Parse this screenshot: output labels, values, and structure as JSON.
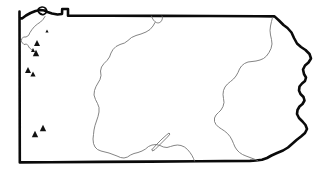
{
  "figure": {
    "kind": "outline-map",
    "title": "",
    "caption": "",
    "background_color": "#ffffff",
    "border_color": "#0a0a0a",
    "interior_line_color": "#6e6e6e",
    "marker_color": "#111111",
    "marker_shape": "triangle",
    "border_width_px": 2.6,
    "interior_line_width_px": 0.85,
    "width_px": 330,
    "height_px": 176
  },
  "layers": {
    "state_outline": {
      "name": "state-outline",
      "label": "",
      "visible": true
    },
    "lake_erie_peninsula": {
      "name": "presque-isle-peninsula",
      "label": "",
      "visible": true
    },
    "interior_boundaries": {
      "name": "interior-boundaries",
      "label": "",
      "count": 4,
      "visible": true
    },
    "site_markers": {
      "name": "site-markers",
      "label": "",
      "count": 8,
      "visible": true,
      "points": [
        {
          "x": 47,
          "y": 31,
          "size": 1.6
        },
        {
          "x": 37,
          "y": 43,
          "size": 3.0
        },
        {
          "x": 33,
          "y": 50,
          "size": 2.0
        },
        {
          "x": 36,
          "y": 53,
          "size": 3.2
        },
        {
          "x": 28,
          "y": 70,
          "size": 3.0
        },
        {
          "x": 33,
          "y": 74,
          "size": 2.6
        },
        {
          "x": 43,
          "y": 128,
          "size": 3.2
        },
        {
          "x": 35,
          "y": 134,
          "size": 3.2
        }
      ]
    }
  }
}
